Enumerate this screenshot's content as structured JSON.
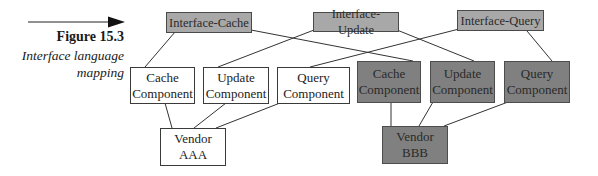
{
  "figure": {
    "number_label": "Figure 15.3",
    "caption_line1": "Interface language",
    "caption_line2": "mapping",
    "pointer": "arrow-right"
  },
  "colors": {
    "interface_fill": "#a8a8a8",
    "vendor_bbb_fill": "#808080",
    "vendor_aaa_fill": "#ffffff",
    "line": "#333333"
  },
  "interfaces": [
    {
      "id": "ic",
      "label": "Interface-Cache"
    },
    {
      "id": "iu",
      "label": "Interface-Update"
    },
    {
      "id": "iq",
      "label": "Interface-Query"
    }
  ],
  "vendor_aaa_components": [
    {
      "id": "a-cache",
      "line1": "Cache",
      "line2": "Component"
    },
    {
      "id": "a-update",
      "line1": "Update",
      "line2": "Component"
    },
    {
      "id": "a-query",
      "line1": "Query",
      "line2": "Component"
    }
  ],
  "vendor_bbb_components": [
    {
      "id": "b-cache",
      "line1": "Cache",
      "line2": "Component"
    },
    {
      "id": "b-update",
      "line1": "Update",
      "line2": "Component"
    },
    {
      "id": "b-query",
      "line1": "Query",
      "line2": "Component"
    }
  ],
  "vendors": [
    {
      "id": "aaa",
      "label": "Vendor AAA"
    },
    {
      "id": "bbb",
      "label": "Vendor BBB"
    }
  ],
  "edges": [
    [
      "Interface-Cache",
      "Cache Component (AAA)"
    ],
    [
      "Interface-Cache",
      "Cache Component (BBB)"
    ],
    [
      "Interface-Update",
      "Update Component (AAA)"
    ],
    [
      "Interface-Update",
      "Update Component (BBB)"
    ],
    [
      "Interface-Query",
      "Query Component (AAA)"
    ],
    [
      "Interface-Query",
      "Query Component (BBB)"
    ],
    [
      "Cache Component (AAA)",
      "Vendor AAA"
    ],
    [
      "Update Component (AAA)",
      "Vendor AAA"
    ],
    [
      "Query Component (AAA)",
      "Vendor AAA"
    ],
    [
      "Cache Component (BBB)",
      "Vendor BBB"
    ],
    [
      "Update Component (BBB)",
      "Vendor BBB"
    ],
    [
      "Query Component (BBB)",
      "Vendor BBB"
    ]
  ]
}
